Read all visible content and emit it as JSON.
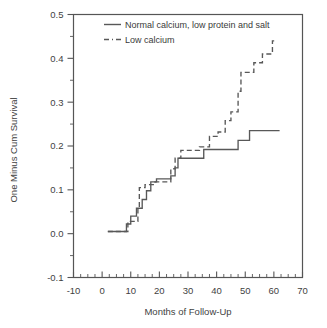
{
  "chart_data": {
    "type": "line",
    "subtype": "kaplan-meier-step",
    "title": "",
    "xlabel": "Months of Follow-Up",
    "ylabel": "One Minus Cum Survival",
    "xlim": [
      -10,
      70
    ],
    "ylim": [
      -0.1,
      0.5
    ],
    "xticks": [
      -10,
      0,
      10,
      20,
      30,
      40,
      50,
      60,
      70
    ],
    "xticklabels": [
      "-10",
      "0",
      "10",
      "20",
      "30",
      "40",
      "50",
      "60",
      "70"
    ],
    "yticks": [
      -0.1,
      0.0,
      0.1,
      0.2,
      0.3,
      0.4,
      0.5
    ],
    "yticklabels": [
      "-0.1",
      "0.0",
      "0.1",
      "0.2",
      "0.3",
      "0.4",
      "0.5"
    ],
    "x_minor_step": 2.5,
    "y_minor_step": 0.05,
    "grid": false,
    "legend_position": "top-center",
    "line_color": "#585858",
    "series": [
      {
        "name": "Normal calcium, low protein and salt",
        "style": "solid",
        "points": [
          [
            2.0,
            0.005
          ],
          [
            8.5,
            0.005
          ],
          [
            8.5,
            0.022
          ],
          [
            10.0,
            0.022
          ],
          [
            10.0,
            0.04
          ],
          [
            12.0,
            0.04
          ],
          [
            12.0,
            0.058
          ],
          [
            14.0,
            0.058
          ],
          [
            14.0,
            0.078
          ],
          [
            15.5,
            0.078
          ],
          [
            15.5,
            0.098
          ],
          [
            17.0,
            0.098
          ],
          [
            17.0,
            0.118
          ],
          [
            19.0,
            0.118
          ],
          [
            19.0,
            0.125
          ],
          [
            24.0,
            0.125
          ],
          [
            24.0,
            0.132
          ],
          [
            25.5,
            0.132
          ],
          [
            25.5,
            0.15
          ],
          [
            26.5,
            0.15
          ],
          [
            26.5,
            0.172
          ],
          [
            35.5,
            0.172
          ],
          [
            35.5,
            0.192
          ],
          [
            47.5,
            0.192
          ],
          [
            47.5,
            0.213
          ],
          [
            51.5,
            0.213
          ],
          [
            51.5,
            0.235
          ],
          [
            62.0,
            0.235
          ]
        ]
      },
      {
        "name": "Low calcium",
        "style": "dashed",
        "points": [
          [
            2.0,
            0.005
          ],
          [
            9.0,
            0.005
          ],
          [
            9.0,
            0.028
          ],
          [
            12.5,
            0.028
          ],
          [
            12.5,
            0.058
          ],
          [
            13.0,
            0.058
          ],
          [
            13.0,
            0.105
          ],
          [
            15.0,
            0.105
          ],
          [
            15.0,
            0.112
          ],
          [
            18.5,
            0.112
          ],
          [
            18.5,
            0.118
          ],
          [
            24.0,
            0.118
          ],
          [
            24.0,
            0.148
          ],
          [
            25.5,
            0.148
          ],
          [
            25.5,
            0.172
          ],
          [
            27.5,
            0.172
          ],
          [
            27.5,
            0.19
          ],
          [
            34.0,
            0.19
          ],
          [
            34.0,
            0.198
          ],
          [
            37.5,
            0.198
          ],
          [
            37.5,
            0.222
          ],
          [
            40.5,
            0.222
          ],
          [
            40.5,
            0.232
          ],
          [
            43.0,
            0.232
          ],
          [
            43.0,
            0.258
          ],
          [
            45.0,
            0.258
          ],
          [
            45.0,
            0.278
          ],
          [
            47.5,
            0.278
          ],
          [
            47.5,
            0.325
          ],
          [
            48.5,
            0.325
          ],
          [
            48.5,
            0.368
          ],
          [
            53.0,
            0.368
          ],
          [
            53.0,
            0.39
          ],
          [
            56.0,
            0.39
          ],
          [
            56.0,
            0.41
          ],
          [
            59.5,
            0.41
          ],
          [
            59.5,
            0.44
          ],
          [
            60.5,
            0.44
          ]
        ]
      }
    ],
    "legend": [
      {
        "label": "Normal calcium, low protein and salt",
        "style": "solid"
      },
      {
        "label": "Low calcium",
        "style": "dash-dot"
      }
    ]
  }
}
